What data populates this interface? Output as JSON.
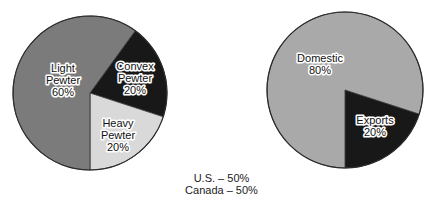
{
  "chart_data": [
    {
      "type": "pie",
      "title": "",
      "center": [
        90,
        93
      ],
      "radius": 77,
      "start_angle_deg": 36,
      "slices": [
        {
          "label": "Convex Pewter",
          "value": 20,
          "value_label": "20%",
          "color": "#181818",
          "label_lines": [
            "Convex",
            "Pewter",
            "20%"
          ],
          "label_pos": [
            135,
            70
          ]
        },
        {
          "label": "Heavy Pewter",
          "value": 20,
          "value_label": "20%",
          "color": "#d9d9d9",
          "label_lines": [
            "Heavy",
            "Pewter",
            "20%"
          ],
          "label_pos": [
            118,
            127
          ]
        },
        {
          "label": "Light Pewter",
          "value": 60,
          "value_label": "60%",
          "color": "#7b7b7b",
          "label_lines": [
            "Light",
            "Pewter",
            "60%"
          ],
          "label_pos": [
            63,
            72
          ]
        }
      ]
    },
    {
      "type": "pie",
      "title": "",
      "center": [
        345,
        90
      ],
      "radius": 78,
      "start_angle_deg": 108,
      "slices": [
        {
          "label": "Exports",
          "value": 20,
          "value_label": "20%",
          "color": "#181818",
          "label_lines": [
            "Exports",
            "20%"
          ],
          "label_pos": [
            375,
            124
          ]
        },
        {
          "label": "Domestic",
          "value": 80,
          "value_label": "80%",
          "color": "#a9a9a9",
          "label_lines": [
            "Domestic",
            "80%"
          ],
          "label_pos": [
            320,
            62
          ]
        }
      ]
    }
  ],
  "footnote": {
    "lines": [
      "U.S. – 50%",
      "Canada – 50%"
    ]
  }
}
